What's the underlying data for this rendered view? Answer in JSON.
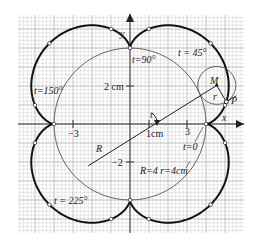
{
  "diagram": {
    "type": "epicycloid",
    "fixed_circle_radius_cm": 4,
    "rolling_circle_radius_cm": 1,
    "axis_range_cm": [
      -6,
      6
    ],
    "rolling_circle_angle_deg": 24,
    "labels": {
      "y_axis": "y",
      "x_axis": "x",
      "t90": "t=90°",
      "t45": "t = 45°",
      "t150": "t=150°",
      "t225": "t = 225°",
      "t0": "t=0",
      "two_cm": "2 cm",
      "neg_two": "−2",
      "neg_three": "−3",
      "one_cm": "1cm",
      "three": "3",
      "R": "R",
      "t": "t",
      "M": "M",
      "r": "r",
      "P": "P",
      "relation": "R=4 r=4cm"
    },
    "marked_points_t_deg": [
      0,
      22.5,
      45,
      67.5,
      90,
      112.5,
      135,
      157.5,
      180,
      202.5,
      225,
      247.5,
      270,
      292.5,
      315,
      337.5
    ],
    "colors": {
      "grid": "#c8c8c8",
      "grid_major": "#a8a8a8",
      "curve": "#111111",
      "circle": "#555555",
      "axis": "#333333"
    }
  }
}
